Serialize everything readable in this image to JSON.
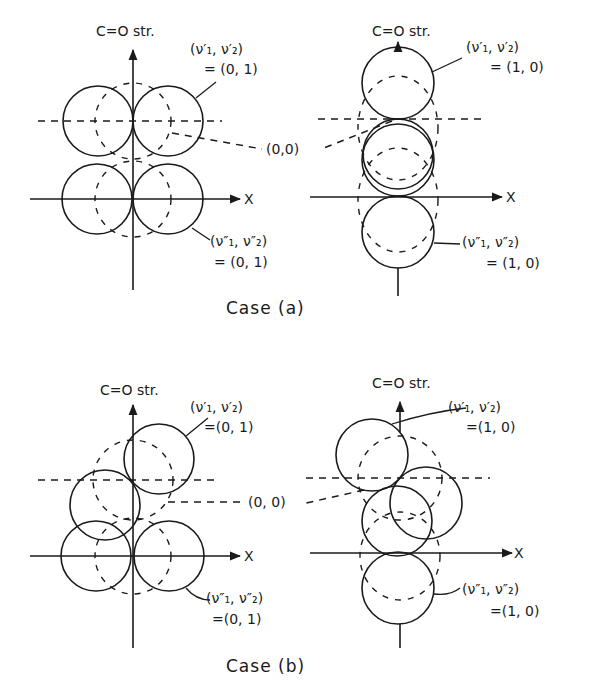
{
  "figure": {
    "panels": [
      {
        "id": "a-left",
        "y_axis_label": "C=O str.",
        "x_axis_label": "X",
        "upper_label_line1": "(ν′₁, ν′₂)",
        "upper_label_line2": "= (0, 1)",
        "lower_label_line1": "(ν″₁, ν″₂)",
        "lower_label_line2": "= (0, 1)"
      },
      {
        "id": "a-right",
        "y_axis_label": "C=O str.",
        "x_axis_label": "X",
        "upper_label_line1": "(ν′₁, ν′₂)",
        "upper_label_line2": "= (1, 0)",
        "lower_label_line1": "(ν″₁, ν″₂)",
        "lower_label_line2": "= (1, 0)"
      },
      {
        "id": "b-left",
        "y_axis_label": "C=O str.",
        "x_axis_label": "X",
        "upper_label_line1": "(ν′₁, ν′₂)",
        "upper_label_line2": "=(0, 1)",
        "lower_label_line1": "(ν″₁, ν″₂)",
        "lower_label_line2": "=(0, 1)"
      },
      {
        "id": "b-right",
        "y_axis_label": "C=O str.",
        "x_axis_label": "X",
        "upper_label_line1": "(ν′₁, ν′₂)",
        "upper_label_line2": "=(1, 0)",
        "lower_label_line1": "(ν″₁, ν″₂)",
        "lower_label_line2": "=(1, 0)"
      }
    ],
    "ground_state_label_a": "(0,0)",
    "ground_state_label_b": "(0, 0)",
    "caption_a": "Case (a)",
    "caption_b": "Case (b)"
  }
}
